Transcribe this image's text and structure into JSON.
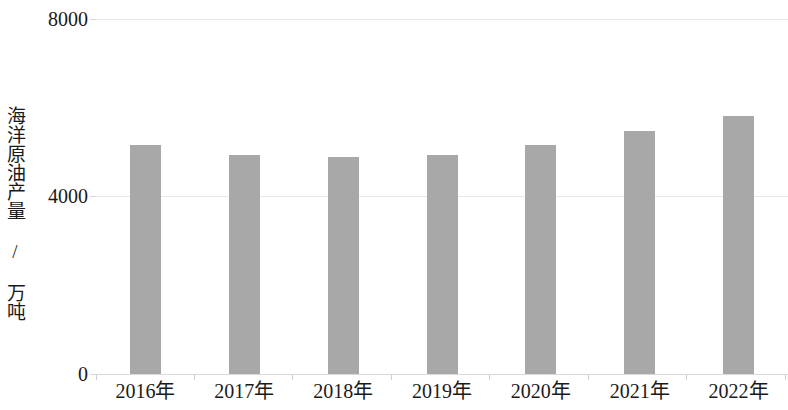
{
  "chart_data": {
    "type": "bar",
    "title": "",
    "subtitle": "",
    "xlabel": "",
    "ylabel": "海洋原油产量 / 万吨",
    "categories": [
      "2016年",
      "2017年",
      "2018年",
      "2019年",
      "2020年",
      "2021年",
      "2022年"
    ],
    "values": [
      5160,
      4930,
      4890,
      4930,
      5160,
      5480,
      5810
    ],
    "series": [
      {
        "name": "海洋原油产量",
        "values": [
          5160,
          4930,
          4890,
          4930,
          5160,
          5480,
          5810
        ]
      }
    ],
    "ylim": [
      0,
      8000
    ],
    "y_ticks": [
      0,
      4000,
      8000
    ],
    "y_tick_labels": [
      "0",
      "4000",
      "8000"
    ],
    "grid": true,
    "legend": false,
    "legend_position": "none",
    "bar_color": "#a8a8a8",
    "gridline_color": "#e9e9e9",
    "axis_text_color": "#1a1a1a",
    "background_color": "#ffffff"
  },
  "axes": {
    "y_title": "海洋原油产量 / 万吨",
    "y_tick_8000": "8000",
    "y_tick_4000": "4000",
    "y_tick_0": "0",
    "x_tick_0": "2016年",
    "x_tick_1": "2017年",
    "x_tick_2": "2018年",
    "x_tick_3": "2019年",
    "x_tick_4": "2020年",
    "x_tick_5": "2021年",
    "x_tick_6": "2022年"
  }
}
